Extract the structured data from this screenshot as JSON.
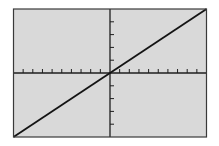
{
  "colors": {
    "screen_bg": "#d9d9d9",
    "frame": "#3a3a3a",
    "axis": "#1e1e1e",
    "plot_line": "#141414",
    "page_bg": "#ffffff"
  },
  "chart_data": {
    "type": "line",
    "title": "",
    "xlabel": "",
    "ylabel": "",
    "function": "y = x",
    "xlim": [
      -10,
      10
    ],
    "ylim": [
      -10,
      10
    ],
    "x_ticks_per_side": 10,
    "y_ticks_per_side": 5,
    "grid": false,
    "legend": "none",
    "series": [
      {
        "name": "Y1",
        "x": [
          -10,
          10
        ],
        "y": [
          -10,
          10
        ]
      }
    ]
  }
}
